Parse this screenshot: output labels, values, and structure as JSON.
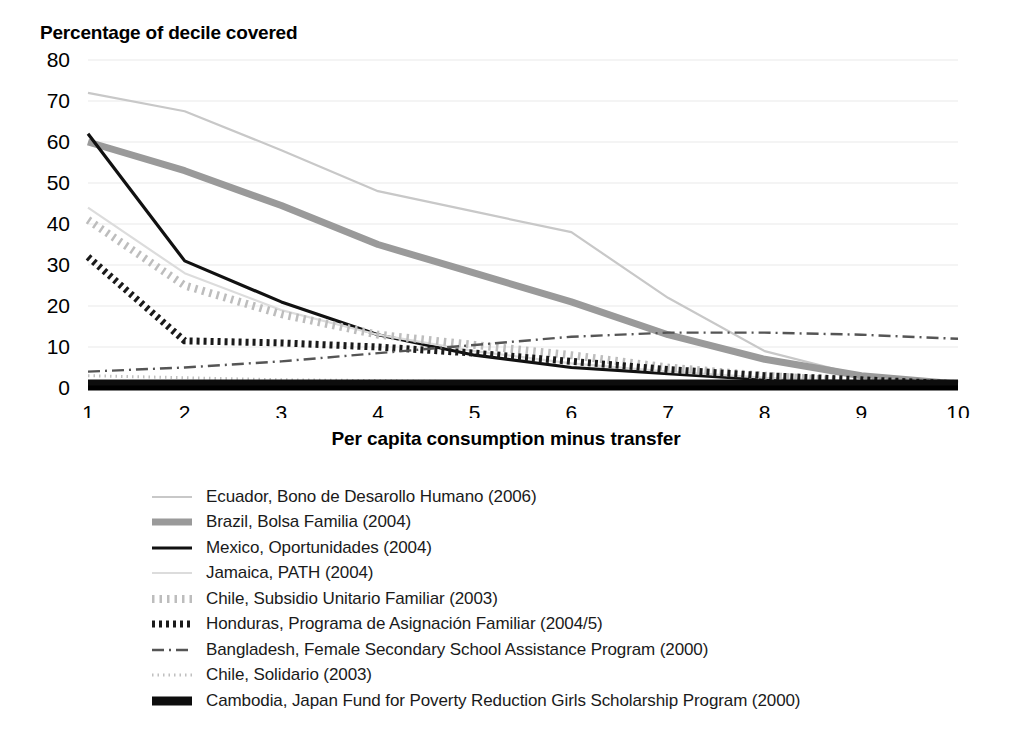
{
  "chart_data": {
    "type": "line",
    "title": "Percentage of decile covered",
    "xlabel": "Per capita consumption minus transfer",
    "ylabel": "",
    "xlim": [
      1,
      10
    ],
    "ylim": [
      0,
      80
    ],
    "yticks": [
      0,
      10,
      20,
      30,
      40,
      50,
      60,
      70,
      80
    ],
    "xticks": [
      1,
      2,
      3,
      4,
      5,
      6,
      7,
      8,
      9,
      10
    ],
    "grid": true,
    "legend_position": "below",
    "x": [
      1,
      2,
      3,
      4,
      5,
      6,
      7,
      8,
      9,
      10
    ],
    "series": [
      {
        "name": "Ecuador, Bono de Desarollo Humano (2006)",
        "style": "solid-thin-light",
        "color": "#c8c8c8",
        "values": [
          72,
          67.5,
          58,
          48,
          43,
          38,
          22,
          9,
          3,
          1
        ]
      },
      {
        "name": "Brazil, Bolsa Familia (2004)",
        "style": "solid-thick-gray",
        "color": "#9a9a9a",
        "values": [
          60,
          53,
          44.5,
          35,
          28,
          21,
          13,
          7,
          3,
          1
        ]
      },
      {
        "name": "Mexico, Oportunidades (2004)",
        "style": "solid-black",
        "color": "#111111",
        "values": [
          62,
          31,
          21,
          13,
          8,
          5,
          3.5,
          2,
          1.5,
          1
        ]
      },
      {
        "name": "Jamaica, PATH (2004)",
        "style": "solid-verylight",
        "color": "#dcdcdc",
        "values": [
          44,
          28,
          19,
          13,
          9,
          6,
          4,
          2.5,
          1.5,
          1
        ]
      },
      {
        "name": "Chile, Subsidio Unitario Familiar (2003)",
        "style": "dotted-light",
        "color": "#bdbdbd",
        "values": [
          41,
          25,
          18,
          13,
          10.5,
          8,
          5,
          3,
          1.5,
          1
        ]
      },
      {
        "name": "Honduras, Programa de Asignación Familiar (2004/5)",
        "style": "dotted-black",
        "color": "#1a1a1a",
        "values": [
          32,
          11.5,
          11,
          10,
          8.5,
          6.5,
          4.5,
          3,
          2,
          1
        ]
      },
      {
        "name": "Bangladesh, Female Secondary School Assistance Program (2000)",
        "style": "dash-dot",
        "color": "#555555",
        "values": [
          4,
          5,
          6.5,
          8.5,
          10.5,
          12.5,
          13.5,
          13.5,
          13,
          12
        ]
      },
      {
        "name": "Chile, Solidario (2003)",
        "style": "fine-dotted",
        "color": "#c0c0c0",
        "values": [
          3,
          2.5,
          2,
          1.8,
          1.5,
          1.3,
          1.2,
          1.1,
          1,
          1
        ]
      },
      {
        "name": "Cambodia, Japan Fund for Poverty Reduction Girls Scholarship Program (2000)",
        "style": "solid-verythick-black",
        "color": "#0d0d0d",
        "values": [
          1,
          1,
          1,
          1,
          1,
          1,
          1,
          1,
          1,
          1
        ]
      }
    ]
  },
  "chart": {
    "title": "Percentage of decile covered",
    "xlabel": "Per capita consumption minus transfer"
  }
}
